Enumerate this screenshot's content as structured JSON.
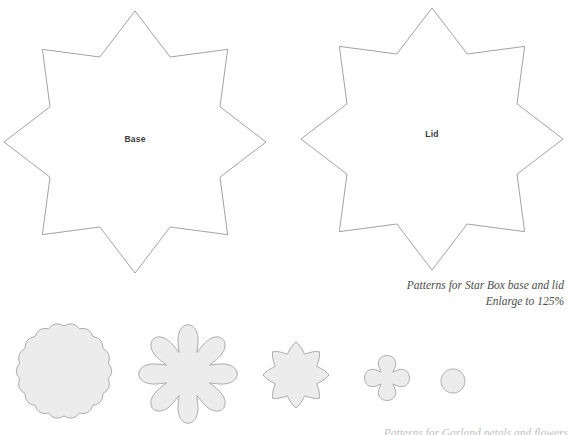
{
  "page": {
    "kind": "craft-pattern-sheet",
    "background_color": "#ffffff",
    "width": 572,
    "height": 435
  },
  "patterns": {
    "stars": [
      {
        "name": "base",
        "label": "Base",
        "points": 8,
        "outline_color": "#7a7a7a",
        "fill_color": "#ffffff",
        "center_x": 135,
        "center_y": 142,
        "outer_radius": 131,
        "inner_radius": 92
      },
      {
        "name": "lid",
        "label": "Lid",
        "points": 8,
        "outline_color": "#7a7a7a",
        "fill_color": "#ffffff",
        "center_x": 432,
        "center_y": 139,
        "outer_radius": 131,
        "inner_radius": 92
      }
    ],
    "scallops": [
      {
        "name": "large-scalloped-circle",
        "center_x": 64,
        "center_y": 371,
        "radius": 49,
        "lobes": 18,
        "lobe_depth": 4,
        "style": "scalloped-circle",
        "fill_color": "#ececec",
        "outline_color": "#9a9a9a"
      },
      {
        "name": "eight-lobe-flower",
        "center_x": 188,
        "center_y": 374,
        "radius": 46,
        "lobes": 8,
        "lobe_depth": 14,
        "style": "slit-flower",
        "fill_color": "#ececec",
        "outline_color": "#9a9a9a"
      },
      {
        "name": "scalloped-octagon",
        "center_x": 296,
        "center_y": 375,
        "radius": 33,
        "lobes": 8,
        "lobe_depth": 5,
        "style": "scalloped-star",
        "fill_color": "#ececec",
        "outline_color": "#9a9a9a"
      },
      {
        "name": "quatrefoil",
        "center_x": 387,
        "center_y": 378,
        "radius": 23,
        "lobes": 4,
        "lobe_depth": 9,
        "style": "slit-flower",
        "fill_color": "#ececec",
        "outline_color": "#9a9a9a"
      },
      {
        "name": "small-circle",
        "center_x": 453,
        "center_y": 381,
        "radius": 12,
        "lobes": 0,
        "lobe_depth": 0,
        "style": "circle",
        "fill_color": "#ececec",
        "outline_color": "#9a9a9a"
      }
    ]
  },
  "caption": {
    "line1": "Patterns for Star Box base and lid",
    "line2": "Enlarge to 125%"
  },
  "caption_bottom": {
    "text": "Patterns for Garland petals and flowers"
  }
}
